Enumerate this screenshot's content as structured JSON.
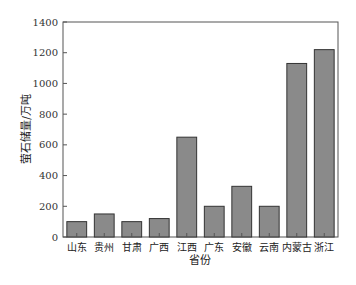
{
  "chart_data": {
    "type": "bar",
    "title": "",
    "xlabel": "省份",
    "ylabel": "萤石储量/万吨",
    "categories": [
      "山东",
      "贵州",
      "甘肃",
      "广西",
      "江西",
      "广东",
      "安徽",
      "云南",
      "内蒙古",
      "浙江"
    ],
    "values": [
      100,
      150,
      100,
      120,
      650,
      200,
      330,
      200,
      1130,
      1220
    ],
    "ylim": [
      0,
      1400
    ],
    "yticks": [
      0,
      200,
      400,
      600,
      800,
      1000,
      1200,
      1400
    ],
    "grid": false,
    "legend": null,
    "colors": {
      "bar_fill": "#8a8a8a",
      "bar_stroke": "#333333",
      "axis": "#555555"
    }
  }
}
